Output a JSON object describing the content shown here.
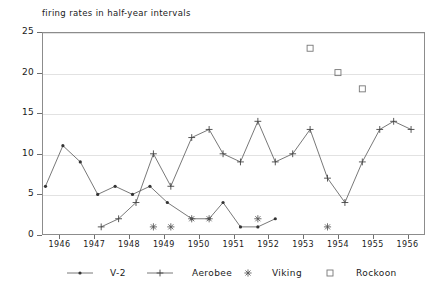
{
  "chart_data": {
    "type": "line",
    "title": "firing rates in half-year intervals",
    "xlabel": "",
    "ylabel": "",
    "xlim": [
      1945.5,
      1956.5
    ],
    "ylim": [
      0,
      25
    ],
    "grid": true,
    "legend_position": "bottom",
    "x_ticks": [
      "1946",
      "1947",
      "1948",
      "1949",
      "1950",
      "1951",
      "1952",
      "1953",
      "1954",
      "1955",
      "1956"
    ],
    "y_ticks": [
      "0",
      "5",
      "10",
      "15",
      "20",
      "25"
    ],
    "series": [
      {
        "name": "V-2",
        "marker": "dot",
        "line": true,
        "color": "#555555",
        "points": [
          {
            "x": 1945.6,
            "y": 6
          },
          {
            "x": 1946.1,
            "y": 11
          },
          {
            "x": 1946.6,
            "y": 9
          },
          {
            "x": 1947.1,
            "y": 5
          },
          {
            "x": 1947.6,
            "y": 6
          },
          {
            "x": 1948.1,
            "y": 5
          },
          {
            "x": 1948.6,
            "y": 6
          },
          {
            "x": 1949.1,
            "y": 4
          },
          {
            "x": 1949.8,
            "y": 2
          },
          {
            "x": 1950.3,
            "y": 2
          },
          {
            "x": 1950.7,
            "y": 4
          },
          {
            "x": 1951.2,
            "y": 1
          },
          {
            "x": 1951.7,
            "y": 1
          },
          {
            "x": 1952.2,
            "y": 2
          }
        ]
      },
      {
        "name": "Aerobee",
        "marker": "plus",
        "line": true,
        "color": "#555555",
        "points": [
          {
            "x": 1947.2,
            "y": 1
          },
          {
            "x": 1947.7,
            "y": 2
          },
          {
            "x": 1948.2,
            "y": 4
          },
          {
            "x": 1948.7,
            "y": 10
          },
          {
            "x": 1949.2,
            "y": 6
          },
          {
            "x": 1949.8,
            "y": 12
          },
          {
            "x": 1950.3,
            "y": 13
          },
          {
            "x": 1950.7,
            "y": 10
          },
          {
            "x": 1951.2,
            "y": 9
          },
          {
            "x": 1951.7,
            "y": 14
          },
          {
            "x": 1952.2,
            "y": 9
          },
          {
            "x": 1952.7,
            "y": 10
          },
          {
            "x": 1953.2,
            "y": 13
          },
          {
            "x": 1953.7,
            "y": 7
          },
          {
            "x": 1954.2,
            "y": 4
          },
          {
            "x": 1954.7,
            "y": 9
          },
          {
            "x": 1955.2,
            "y": 13
          },
          {
            "x": 1955.6,
            "y": 14
          },
          {
            "x": 1956.1,
            "y": 13
          }
        ]
      },
      {
        "name": "Viking",
        "marker": "asterisk",
        "line": false,
        "color": "#555555",
        "points": [
          {
            "x": 1948.7,
            "y": 1
          },
          {
            "x": 1949.2,
            "y": 1
          },
          {
            "x": 1949.8,
            "y": 2
          },
          {
            "x": 1950.3,
            "y": 2
          },
          {
            "x": 1951.7,
            "y": 2
          },
          {
            "x": 1953.7,
            "y": 1
          }
        ]
      },
      {
        "name": "Rockoon",
        "marker": "square",
        "line": false,
        "color": "#777777",
        "points": [
          {
            "x": 1953.2,
            "y": 23
          },
          {
            "x": 1954.0,
            "y": 20
          },
          {
            "x": 1954.7,
            "y": 18
          }
        ]
      }
    ]
  },
  "legend": {
    "items": [
      {
        "label": "V-2",
        "marker": "dot"
      },
      {
        "label": "Aerobee",
        "marker": "plus"
      },
      {
        "label": "Viking",
        "marker": "asterisk"
      },
      {
        "label": "Rockoon",
        "marker": "square"
      }
    ]
  }
}
